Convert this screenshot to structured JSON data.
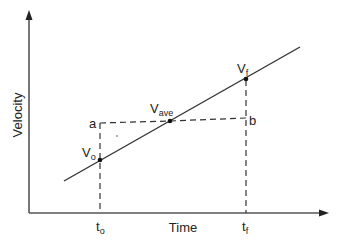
{
  "diagram": {
    "type": "velocity-time graph",
    "axes": {
      "x_label": "Time",
      "y_label": "Velocity"
    },
    "points": {
      "v_initial": {
        "label": "V",
        "sub": "o"
      },
      "v_average": {
        "label": "V",
        "sub": "ave"
      },
      "v_final": {
        "label": "V",
        "sub": "f"
      }
    },
    "corner_labels": {
      "a": "a",
      "b": "b"
    },
    "time_ticks": {
      "t_initial": {
        "label": "t",
        "sub": "o"
      },
      "t_final": {
        "label": "t",
        "sub": "f"
      }
    },
    "colors": {
      "line": "#333333",
      "axis": "#555555",
      "text": "#222222",
      "background": "#ffffff"
    }
  }
}
